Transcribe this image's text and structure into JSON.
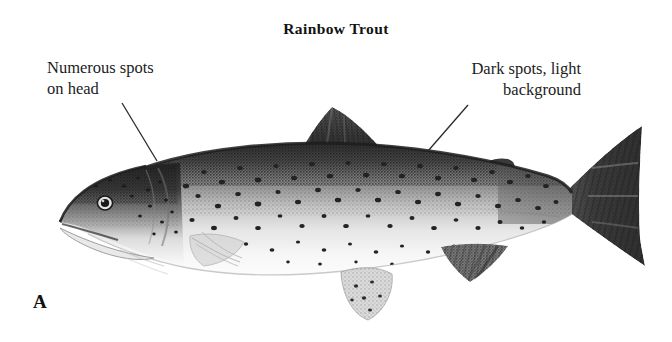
{
  "figure": {
    "title": "Rainbow Trout",
    "panel_label": "A",
    "background_color": "#ffffff",
    "ink_color": "#1a1a1a"
  },
  "callouts": [
    {
      "id": "head-spots",
      "text": "Numerous spots\non head",
      "align": "left",
      "leader_from": [
        122,
        103
      ],
      "leader_to": [
        157,
        161
      ]
    },
    {
      "id": "body-spots",
      "text": "Dark spots, light\nbackground",
      "align": "right",
      "leader_from": [
        468,
        105
      ],
      "leader_to": [
        428,
        151
      ]
    }
  ],
  "illustration": {
    "subject": "rainbow-trout",
    "style": "halftone-engraving",
    "orientation": "left-facing-profile",
    "tones": {
      "dorsal_dark": "#3a3a3a",
      "mid_grey": "#8e8e8e",
      "belly_light": "#f2f2f2",
      "spot_color": "#2b2b2b",
      "outline": "#4a4a4a"
    },
    "features": [
      "snout",
      "mouth",
      "eye",
      "gill-cover",
      "pectoral-fin",
      "pelvic-fin",
      "anal-fin",
      "dorsal-fin",
      "adipose-fin",
      "caudal-fin"
    ],
    "eye_position": [
      105,
      203
    ],
    "extent": {
      "x_min": 58,
      "x_max": 648,
      "y_min": 100,
      "y_max": 322
    }
  }
}
